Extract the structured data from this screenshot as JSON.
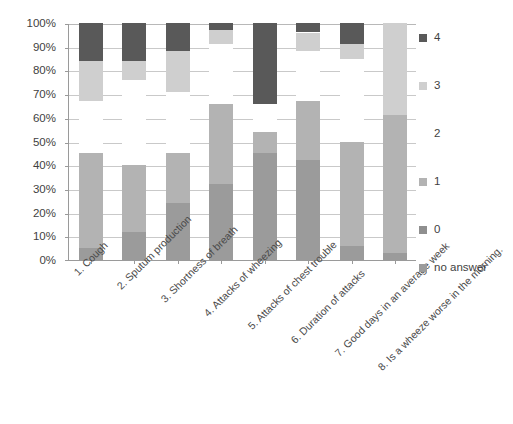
{
  "chart_data": {
    "type": "bar",
    "subtype": "stacked-percentage-bar",
    "title": "",
    "subtitle": "",
    "xlabel": "",
    "ylabel": "",
    "ylim": [
      0,
      100
    ],
    "yticks": [
      "0%",
      "10%",
      "20%",
      "30%",
      "40%",
      "50%",
      "60%",
      "70%",
      "80%",
      "90%",
      "100%"
    ],
    "ytick_values": [
      0,
      10,
      20,
      30,
      40,
      50,
      60,
      70,
      80,
      90,
      100
    ],
    "grid": true,
    "grid_axis": "y",
    "legend_position": "right",
    "categories": [
      "1. Cough",
      "2. Sputum production",
      "3. Shortness of breath",
      "4. Attacks of wheezing",
      "5. Attacks of chest trouble",
      "6. Duration of attacks",
      "7. Good days in an average week",
      "8. Is a wheeze worse in the morning."
    ],
    "series": [
      {
        "name": "no answer",
        "color": "#9b9b9b",
        "values": [
          5,
          12,
          24,
          32,
          45,
          42,
          6,
          3
        ]
      },
      {
        "name": "0",
        "color": "#8f8f8f",
        "values": [
          0,
          0,
          0,
          0,
          0,
          0,
          0,
          0
        ]
      },
      {
        "name": "1",
        "color": "#b3b3b3",
        "values": [
          40,
          28,
          21,
          34,
          9,
          25,
          44,
          58
        ]
      },
      {
        "name": "2",
        "color": "#ffffff",
        "values": [
          22,
          36,
          26,
          25,
          12,
          21,
          35,
          0
        ]
      },
      {
        "name": "3",
        "color": "#cfcfcf",
        "values": [
          17,
          8,
          17,
          6,
          0,
          8,
          6,
          39
        ]
      },
      {
        "name": "4",
        "color": "#595959",
        "values": [
          16,
          16,
          12,
          3,
          34,
          4,
          9,
          0
        ]
      }
    ]
  },
  "legend": {
    "items": [
      {
        "label": "4",
        "color": "#595959"
      },
      {
        "label": "3",
        "color": "#cfcfcf"
      },
      {
        "label": "2",
        "color": "#ffffff"
      },
      {
        "label": "1",
        "color": "#b3b3b3"
      },
      {
        "label": "0",
        "color": "#8f8f8f"
      },
      {
        "label": "no answer",
        "color": "#9b9b9b"
      }
    ]
  },
  "axis": {
    "y": {
      "ticks": [
        "100%",
        "90%",
        "80%",
        "70%",
        "60%",
        "50%",
        "40%",
        "30%",
        "20%",
        "10%",
        "0%"
      ]
    },
    "x": {
      "ticks": [
        "1. Cough",
        "2. Sputum production",
        "3. Shortness of breath",
        "4. Attacks of wheezing",
        "5. Attacks of chest trouble",
        "6. Duration of attacks",
        "7. Good days in an average week",
        "8. Is a wheeze worse in the morning."
      ]
    }
  }
}
